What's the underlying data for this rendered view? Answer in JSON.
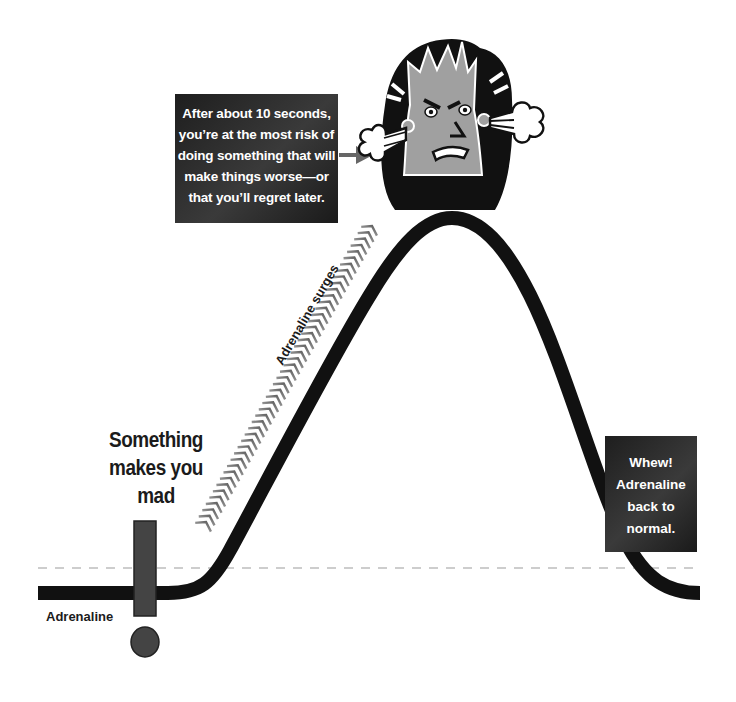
{
  "diagram": {
    "type": "adrenaline-response-curve",
    "callouts": {
      "peak_warning": {
        "lines": [
          "After about 10 seconds,",
          "you’re at the most risk of",
          "doing something that will",
          "make things worse—or",
          "that you’ll regret later."
        ]
      },
      "recovery": {
        "lines": [
          "Whew!",
          "Adrenaline",
          "back to",
          "normal."
        ]
      }
    },
    "labels": {
      "trigger": [
        "Something",
        "makes you",
        "mad"
      ],
      "baseline": "Adrenaline",
      "rising": "Adrenaline surges"
    },
    "icons": {
      "exclamation": "exclamation-mark",
      "angry_face": "angry-person-steaming-ears",
      "arrow": "right-arrow",
      "chevrons": "upward-chevron-stream"
    },
    "colors": {
      "curve": "#111111",
      "box": "#2a2a2a",
      "exclamation": "#444444",
      "dashed_line": "#bbbbbb",
      "chevrons": "#777777",
      "face": "#a0a0a0",
      "arrow": "#666666"
    }
  }
}
